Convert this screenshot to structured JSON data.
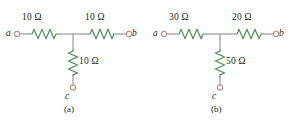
{
  "figure": {
    "background_color": "#ffffff",
    "wire_color": "#8f8f93",
    "resistor_color": "#4f8f5a",
    "terminal_color": "#c98f86",
    "text_color": "#231f20"
  },
  "circuits": [
    {
      "id": "a",
      "caption": "(a)",
      "terminals": [
        {
          "name": "terminal-a",
          "label": "a"
        },
        {
          "name": "terminal-b",
          "label": "b"
        },
        {
          "name": "terminal-c",
          "label": "c"
        }
      ],
      "resistors": [
        {
          "name": "resistor-a-b-left",
          "label": "10 Ω",
          "value": 10,
          "unit": "Ω",
          "orientation": "horizontal"
        },
        {
          "name": "resistor-a-b-right",
          "label": "10 Ω",
          "value": 10,
          "unit": "Ω",
          "orientation": "horizontal"
        },
        {
          "name": "resistor-c-branch",
          "label": "10 Ω",
          "value": 10,
          "unit": "Ω",
          "orientation": "vertical"
        }
      ]
    },
    {
      "id": "b",
      "caption": "(b)",
      "terminals": [
        {
          "name": "terminal-a",
          "label": "a"
        },
        {
          "name": "terminal-b",
          "label": "b"
        },
        {
          "name": "terminal-c",
          "label": "c"
        }
      ],
      "resistors": [
        {
          "name": "resistor-a-b-left",
          "label": "30 Ω",
          "value": 30,
          "unit": "Ω",
          "orientation": "horizontal"
        },
        {
          "name": "resistor-a-b-right",
          "label": "20 Ω",
          "value": 20,
          "unit": "Ω",
          "orientation": "horizontal"
        },
        {
          "name": "resistor-c-branch",
          "label": "50 Ω",
          "value": 50,
          "unit": "Ω",
          "orientation": "vertical"
        }
      ]
    }
  ]
}
